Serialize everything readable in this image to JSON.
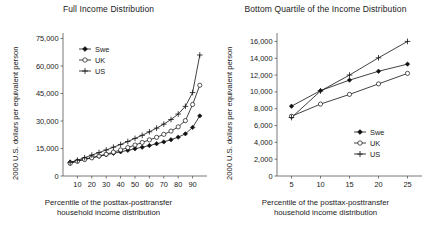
{
  "figure": {
    "background": "#ffffff",
    "width": 434,
    "height": 234,
    "series_colors": {
      "Swe": "#111111",
      "UK": "#111111",
      "US": "#111111"
    }
  },
  "panels": [
    {
      "id": "full-income-distribution",
      "title": "Full Income Distribution",
      "ylabel": "2000 U.S. dollars per equivalent person",
      "xlabel_line1": "Percentile of the posttax-posttransfer",
      "xlabel_line2": "household income distribution",
      "legend": [
        {
          "label": "Swe",
          "marker": "filled-diamond"
        },
        {
          "label": "UK",
          "marker": "open-circle"
        },
        {
          "label": "US",
          "marker": "plus-cross"
        }
      ],
      "yticks": [
        "0",
        "15,000",
        "30,000",
        "45,000",
        "60,000",
        "75,000"
      ],
      "xticks": [
        "10",
        "20",
        "30",
        "40",
        "50",
        "60",
        "70",
        "80",
        "90"
      ]
    },
    {
      "id": "bottom-quartile-of-the-income-distribution",
      "title": "Bottom Quartile of the Income Distribution",
      "ylabel": "2000 U.S. dollars per equivalent person",
      "xlabel_line1": "Percentile of the posttax-posttransfer",
      "xlabel_line2": "household income distribution",
      "legend": [
        {
          "label": "Swe",
          "marker": "filled-diamond"
        },
        {
          "label": "UK",
          "marker": "open-circle"
        },
        {
          "label": "US",
          "marker": "plus-cross"
        }
      ],
      "yticks": [
        "0",
        "2,000",
        "4,000",
        "6,000",
        "8,000",
        "10,000",
        "12,000",
        "14,000",
        "16,000"
      ],
      "xticks": [
        "5",
        "10",
        "15",
        "20",
        "25"
      ]
    }
  ],
  "chart_data": [
    {
      "type": "line",
      "title": "Full Income Distribution",
      "xlabel": "Percentile of the posttax-posttransfer household income distribution",
      "ylabel": "2000 U.S. dollars per equivalent person",
      "xlim": [
        0,
        100
      ],
      "ylim": [
        0,
        78000
      ],
      "yticks": [
        0,
        15000,
        30000,
        45000,
        60000,
        75000
      ],
      "xticks": [
        10,
        20,
        30,
        40,
        50,
        60,
        70,
        80,
        90
      ],
      "grid": false,
      "legend_position": "upper-left-inside",
      "x": [
        5,
        10,
        15,
        20,
        25,
        30,
        35,
        40,
        45,
        50,
        55,
        60,
        65,
        70,
        75,
        80,
        85,
        90,
        95
      ],
      "series": [
        {
          "name": "Swe",
          "marker": "filled-diamond",
          "values": [
            7600,
            8300,
            9200,
            10000,
            10800,
            11600,
            12400,
            13200,
            14000,
            14900,
            15700,
            16600,
            17600,
            18600,
            19800,
            21200,
            23000,
            26500,
            32800
          ]
        },
        {
          "name": "UK",
          "marker": "open-circle",
          "values": [
            6900,
            8000,
            9000,
            9900,
            10900,
            11900,
            13000,
            14200,
            15500,
            16900,
            18300,
            19700,
            21100,
            22700,
            24500,
            26800,
            30200,
            39000,
            49500
          ]
        },
        {
          "name": "US",
          "marker": "plus-cross",
          "values": [
            7300,
            8600,
            10000,
            11400,
            12800,
            14200,
            15700,
            17200,
            18800,
            20500,
            22200,
            24100,
            26100,
            28300,
            30800,
            33800,
            38000,
            45500,
            66000
          ]
        }
      ]
    },
    {
      "type": "line",
      "title": "Bottom Quartile of the Income Distribution",
      "xlabel": "Percentile of the posttax-posttransfer household income distribution",
      "ylabel": "2000 U.S. dollars per equivalent person",
      "xlim": [
        2.5,
        27.5
      ],
      "ylim": [
        0,
        17000
      ],
      "yticks": [
        0,
        2000,
        4000,
        6000,
        8000,
        10000,
        12000,
        14000,
        16000
      ],
      "xticks": [
        5,
        10,
        15,
        20,
        25
      ],
      "grid": false,
      "legend_position": "lower-right-inside",
      "x": [
        5,
        10,
        15,
        20,
        25
      ],
      "series": [
        {
          "name": "Swe",
          "marker": "filled-diamond",
          "values": [
            8300,
            10150,
            11400,
            12450,
            13300
          ]
        },
        {
          "name": "UK",
          "marker": "open-circle",
          "values": [
            7100,
            8550,
            9700,
            10950,
            12200
          ]
        },
        {
          "name": "US",
          "marker": "plus-cross",
          "values": [
            6950,
            10100,
            12000,
            14050,
            16000
          ]
        }
      ]
    }
  ]
}
